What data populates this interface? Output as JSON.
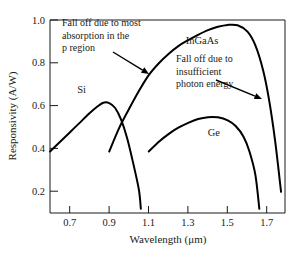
{
  "chart_data": {
    "type": "line",
    "title": "",
    "xlabel": "Wavelength (μm)",
    "ylabel": "Responsivity (A/W)",
    "xlim": [
      0.6,
      1.79
    ],
    "ylim": [
      0.09,
      1.0
    ],
    "grid": false,
    "legend_position": "inline-labels",
    "xticks": [
      0.7,
      0.9,
      1.1,
      1.3,
      1.5,
      1.7
    ],
    "xtick_labels": [
      "0.7",
      "0.9",
      "1.1",
      "1.3",
      "1.5",
      "1.7"
    ],
    "yticks": [
      0.2,
      0.4,
      0.6,
      0.8,
      1.0
    ],
    "ytick_labels": [
      "0.2",
      "0.4",
      "0.6",
      "0.8",
      "1.0"
    ],
    "series": [
      {
        "name": "Si",
        "label": "Si",
        "label_x": 0.76,
        "label_y": 0.655,
        "points": [
          [
            0.6,
            0.38
          ],
          [
            0.65,
            0.425
          ],
          [
            0.7,
            0.47
          ],
          [
            0.75,
            0.515
          ],
          [
            0.8,
            0.56
          ],
          [
            0.84,
            0.592
          ],
          [
            0.87,
            0.61
          ],
          [
            0.9,
            0.608
          ],
          [
            0.93,
            0.585
          ],
          [
            0.96,
            0.53
          ],
          [
            0.99,
            0.445
          ],
          [
            1.02,
            0.33
          ],
          [
            1.05,
            0.2
          ],
          [
            1.06,
            0.11
          ]
        ]
      },
      {
        "name": "InGaAs",
        "label": "InGaAs",
        "label_x": 1.37,
        "label_y": 0.885,
        "points": [
          [
            0.9,
            0.38
          ],
          [
            0.95,
            0.49
          ],
          [
            1.0,
            0.58
          ],
          [
            1.05,
            0.665
          ],
          [
            1.1,
            0.74
          ],
          [
            1.15,
            0.795
          ],
          [
            1.2,
            0.84
          ],
          [
            1.25,
            0.877
          ],
          [
            1.3,
            0.905
          ],
          [
            1.35,
            0.93
          ],
          [
            1.4,
            0.952
          ],
          [
            1.45,
            0.968
          ],
          [
            1.5,
            0.977
          ],
          [
            1.55,
            0.975
          ],
          [
            1.6,
            0.945
          ],
          [
            1.64,
            0.88
          ],
          [
            1.68,
            0.76
          ],
          [
            1.71,
            0.62
          ],
          [
            1.74,
            0.43
          ],
          [
            1.77,
            0.19
          ]
        ]
      },
      {
        "name": "Ge",
        "label": "Ge",
        "label_x": 1.43,
        "label_y": 0.455,
        "points": [
          [
            1.1,
            0.38
          ],
          [
            1.15,
            0.425
          ],
          [
            1.2,
            0.462
          ],
          [
            1.25,
            0.492
          ],
          [
            1.3,
            0.515
          ],
          [
            1.35,
            0.533
          ],
          [
            1.4,
            0.542
          ],
          [
            1.45,
            0.541
          ],
          [
            1.5,
            0.527
          ],
          [
            1.54,
            0.5
          ],
          [
            1.58,
            0.45
          ],
          [
            1.61,
            0.38
          ],
          [
            1.64,
            0.27
          ],
          [
            1.66,
            0.11
          ]
        ]
      }
    ],
    "annotations": [
      {
        "name": "falloff-p-region",
        "lines": [
          "Fall off due to most",
          "absorption in the",
          "p region"
        ],
        "text_x": 62,
        "text_y": 26,
        "arrow_from": [
          113,
          52
        ],
        "arrow_to": [
          149,
          74
        ]
      },
      {
        "name": "falloff-photon-energy",
        "lines": [
          "Fall off due to",
          "insufficient",
          "photon energy"
        ],
        "text_x": 176,
        "text_y": 62,
        "arrow_from": [
          216,
          80
        ],
        "arrow_to": [
          262,
          99
        ]
      }
    ]
  }
}
